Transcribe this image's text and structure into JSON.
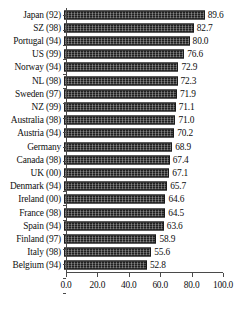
{
  "chart_data": {
    "type": "bar",
    "orientation": "horizontal",
    "title": "",
    "subtitle": "",
    "xlabel": "",
    "ylabel": "",
    "xlim": [
      0.0,
      100.0
    ],
    "xticks": [
      "0.0",
      "20.0",
      "40.0",
      "60.0",
      "80.0",
      "100.0"
    ],
    "xtick_values": [
      0.0,
      20.0,
      40.0,
      60.0,
      80.0,
      100.0
    ],
    "grid": false,
    "legend": "none",
    "show_value_labels": true,
    "bar_color": "#3a3a3a",
    "categories": [
      "Japan (92)",
      "SZ (98)",
      "Portugal (94)",
      "US (99)",
      "Norway (94)",
      "NL (98)",
      "Sweden (97)",
      "NZ (99)",
      "Australia (98)",
      "Austria (94)",
      "Germany",
      "Canada (98)",
      "UK (00)",
      "Denmark (94)",
      "Ireland (00)",
      "France (98)",
      "Spain (94)",
      "Finland (97)",
      "Italy (98)",
      "Belgium (94)"
    ],
    "values": [
      89.6,
      82.7,
      80.0,
      76.6,
      72.9,
      72.3,
      71.9,
      71.1,
      71.0,
      70.2,
      68.9,
      67.4,
      67.1,
      65.7,
      64.6,
      64.5,
      63.6,
      58.9,
      55.6,
      52.8
    ],
    "value_labels": [
      "89.6",
      "82.7",
      "80.0",
      "76.6",
      "72.9",
      "72.3",
      "71.9",
      "71.1",
      "71.0",
      "70.2",
      "68.9",
      "67.4",
      "67.1",
      "65.7",
      "64.6",
      "64.5",
      "63.6",
      "58.9",
      "55.6",
      "52.8"
    ]
  }
}
